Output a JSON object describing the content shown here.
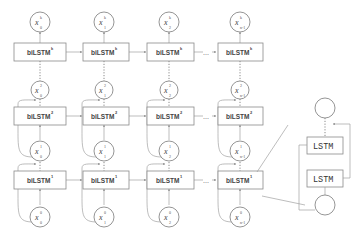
{
  "diagram": {
    "columns": [
      {
        "index": "0"
      },
      {
        "index": "1"
      },
      {
        "index": "2"
      },
      {
        "index": "n-1"
      }
    ],
    "layers": [
      {
        "name": "biLSTM",
        "sup": "k",
        "input_sup": "k-1"
      },
      {
        "name": "biLSTM",
        "sup": "2",
        "input_sup": "1"
      },
      {
        "name": "biLSTM",
        "sup": "1",
        "input_sup": "0"
      }
    ],
    "box_label": "biLSTM",
    "sup_k": "k",
    "sup_2": "2",
    "sup_1": "1",
    "sup_0": "0",
    "ellipsis": "...",
    "x_symbol": "x",
    "sub_0": "0",
    "sub_1": "1",
    "sub_2": "2",
    "sub_n": "n-1",
    "inset": {
      "upper_cell": "LSTM",
      "lower_cell": "LSTM"
    }
  }
}
